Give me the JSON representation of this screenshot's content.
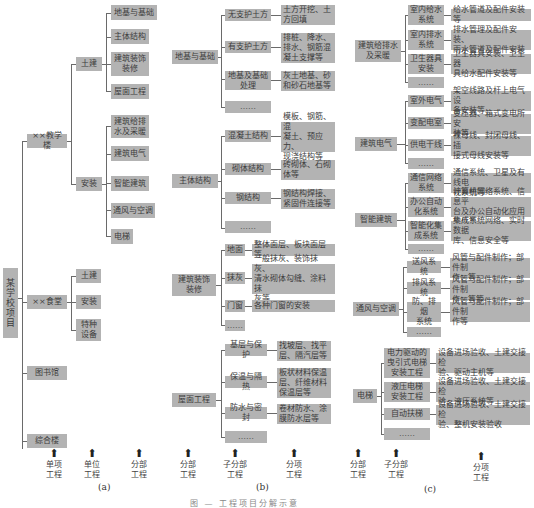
{
  "panel_a": {
    "root": "某学校项目",
    "units": [
      {
        "label": "××教学楼",
        "children": [
          {
            "label": "土建",
            "children": [
              "地基与基础",
              "主体结构",
              "建筑装饰\n装修",
              "屋面工程"
            ]
          },
          {
            "label": "安装",
            "children": [
              "建筑给排\n水及采暖",
              "建筑电气",
              "智能建筑",
              "通风与空调",
              "电梯"
            ]
          }
        ]
      },
      {
        "label": "××食堂",
        "children": [
          {
            "label": "土建"
          },
          {
            "label": "安装"
          },
          {
            "label": "特种\n设备"
          }
        ]
      },
      {
        "label": "图书馆"
      },
      {
        "label": "综合楼"
      }
    ],
    "axis": [
      "单项\n工程",
      "单位\n工程",
      "分部\n工程"
    ],
    "panel_label": "(a)"
  },
  "panel_b": {
    "groups": [
      {
        "label": "地基与基础",
        "subs": [
          {
            "label": "无支护土方",
            "leaf": "土方开挖、土\n方回填"
          },
          {
            "label": "有支护土方",
            "leaf": "排桩、降水、\n排水、钢筋混\n凝土支撑等"
          },
          {
            "label": "地基及基础\n处理",
            "leaf": "灰土地基、砂\n和砂石地基等"
          },
          {
            "label": "……"
          }
        ]
      },
      {
        "label": "主体结构",
        "subs": [
          {
            "label": "混凝土结构",
            "leaf": "模板、钢筋、混\n凝土、预应力、\n现浇结构等"
          },
          {
            "label": "砌体结构",
            "leaf": "砖砌体、石砌\n体等"
          },
          {
            "label": "钢结构",
            "leaf": "钢结构焊接、\n紧固件连接等"
          },
          {
            "label": "……"
          }
        ]
      },
      {
        "label": "建筑装饰\n装修",
        "subs": [
          {
            "label": "地面",
            "leaf": "整体面层、板块面层等"
          },
          {
            "label": "抹灰",
            "leaf": "一般抹灰、装饰抹灰、\n清水砌体勾缝、涂料抹\n灰等"
          },
          {
            "label": "门窗",
            "leaf": "各种门窗的安装"
          },
          {
            "label": "……"
          }
        ]
      },
      {
        "label": "屋面工程",
        "subs": [
          {
            "label": "基层与保护",
            "leaf": "找坡层、找平\n层、隔汽层等"
          },
          {
            "label": "保温与隔热",
            "leaf": "板状材料保温\n层、纤维材料\n保温层等"
          },
          {
            "label": "防水与密封",
            "leaf": "卷材防水、涂\n膜防水层等"
          },
          {
            "label": "……"
          }
        ]
      }
    ],
    "axis": [
      "分部\n工程",
      "子分部\n工程",
      "分项\n工程"
    ],
    "panel_label": "(b)"
  },
  "panel_c": {
    "groups": [
      {
        "label": "建筑给排水\n及采暖",
        "subs": [
          {
            "label": "室内给水\n系统",
            "leaf": "给水管道及配件安装等"
          },
          {
            "label": "室内排水\n系统",
            "leaf": "排水管理及配件安装、\n雨水管道及配件安装"
          },
          {
            "label": "卫生器具\n安装",
            "leaf": "卫生器具安装、卫生器\n具给水配件安装等"
          },
          {
            "label": "……"
          }
        ]
      },
      {
        "label": "建筑电气",
        "subs": [
          {
            "label": "室外电气",
            "leaf": "架空线路及杆上电气设\n备安装等"
          },
          {
            "label": "变配电室",
            "leaf": "变压器、箱式变电所安\n装等"
          },
          {
            "label": "供电干线",
            "leaf": "裸母线、封闭母线、插\n接式母线安装等"
          },
          {
            "label": "……"
          }
        ]
      },
      {
        "label": "智能建筑",
        "subs": [
          {
            "label": "通信网络\n系统",
            "leaf": "通信系统、卫星及有线电\n视系统等"
          },
          {
            "label": "办公自动\n化系统",
            "leaf": "计算机网络系统、信息平\n台及办公自动化应用软件等"
          },
          {
            "label": "智能化集\n成系统",
            "leaf": "集成系统网络、实时数据\n库、信息安全等"
          },
          {
            "label": "……"
          }
        ]
      },
      {
        "label": "通风与空调",
        "subs": [
          {
            "label": "送风系统",
            "leaf": "风管与配件制作；部件制\n作；等"
          },
          {
            "label": "排风系统",
            "leaf": "风管与配件制作；部件制\n作；等等"
          },
          {
            "label": "防、排烟\n系统",
            "leaf": "风管与配件制作；部件制\n作等"
          },
          {
            "label": "……"
          }
        ]
      },
      {
        "label": "电梯",
        "subs": [
          {
            "label": "电力驱动的\n曳引式电梯\n安装工程",
            "leaf": "设备进场验收、土建交接检\n验、驱动主机等"
          },
          {
            "label": "液压电梯\n安装工程",
            "leaf": "设备进场验收、土建交接检\n验、液压系统等"
          },
          {
            "label": "自动扶梯",
            "leaf": "设备进场验收、土建交接检\n验、整机安装验收"
          },
          {
            "label": "……"
          }
        ]
      }
    ],
    "axis": [
      "分部\n工程",
      "子分部\n工程",
      "分项\n工程"
    ],
    "panel_label": "(c)"
  },
  "arrow_glyph": "⬆",
  "caption": "图 — 工程项目分解示意"
}
